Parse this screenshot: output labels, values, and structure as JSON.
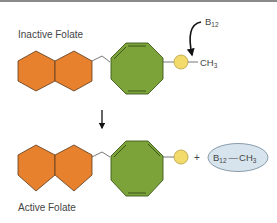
{
  "diagram": {
    "top_label": "Inactive Folate",
    "bottom_label": "Active Folate",
    "methyl": {
      "base": "CH",
      "sub": "3"
    },
    "b12": {
      "base": "B",
      "sub": "12"
    },
    "plus": "+",
    "product": {
      "b12_base": "B",
      "b12_sub": "12",
      "bond": "—",
      "methyl_base": "CH",
      "methyl_sub": "3"
    },
    "colors": {
      "hexagon_fill": "#E8812E",
      "hexagon_stroke": "#5a3a1a",
      "octagon_fill": "#7BA33A",
      "octagon_stroke": "#3f5a1c",
      "circle_fill": "#F2DA6B",
      "ellipse_fill": "#D7E4EE",
      "ellipse_stroke": "#6f8797",
      "arrow": "#111111"
    }
  }
}
